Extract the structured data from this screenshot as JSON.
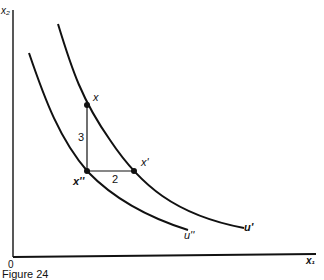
{
  "figure": {
    "caption": "Figure 24",
    "axes": {
      "y_label": "x₂",
      "x_label": "x₁",
      "origin_label": "0"
    },
    "curves": [
      {
        "id": "outer",
        "label": "u'"
      },
      {
        "id": "inner",
        "label": "u''"
      }
    ],
    "points": [
      {
        "id": "x",
        "label": "x"
      },
      {
        "id": "x_prime",
        "label": "x'"
      },
      {
        "id": "x_double_prime",
        "label": "x''"
      }
    ],
    "segments": [
      {
        "id": "vertical",
        "label": "3"
      },
      {
        "id": "horizontal",
        "label": "2"
      }
    ],
    "colors": {
      "ink": "#111111",
      "background": "#ffffff"
    }
  }
}
